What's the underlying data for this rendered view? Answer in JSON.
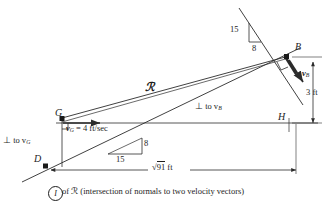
{
  "figure": {
    "type": "kinematics-instant-center-diagram",
    "caption": {
      "circled_symbol": "I",
      "text": "of ℛ (intersection of normals to two velocity vectors)"
    },
    "points": [
      {
        "id": "G",
        "label": "G",
        "x": 62,
        "y": 118
      },
      {
        "id": "B",
        "label": "B",
        "x": 289,
        "y": 56
      },
      {
        "id": "D",
        "label": "D",
        "x": 45,
        "y": 166
      },
      {
        "id": "H",
        "label": "H",
        "x": 289,
        "y": 122
      }
    ],
    "labels": {
      "script_R": "ℛ",
      "perp_to_vG": "⊥ to v",
      "perp_to_vG_sub": "G",
      "perp_to_vB": "⊥ to v",
      "perp_to_vB_sub": "B",
      "vG_value_symbol": "v",
      "vG_value_sub": "G",
      "vG_value_text": " = 4 ft/sec",
      "vB_symbol": "v",
      "vB_sub": "B"
    },
    "dimensions": [
      {
        "name": "vertical-3ft",
        "value": "3 ft"
      },
      {
        "name": "horizontal-sqrt91",
        "radical": "√",
        "radicand": "91",
        "unit": "ft"
      }
    ],
    "slope_triangles": [
      {
        "name": "top-slope-triangle",
        "rise": "15",
        "run": "8"
      },
      {
        "name": "mid-slope-triangle",
        "rise": "8",
        "run": "15"
      }
    ],
    "colors": {
      "line": "#2b2b2b",
      "text": "#1d1d1d",
      "background": "#ffffff"
    }
  }
}
